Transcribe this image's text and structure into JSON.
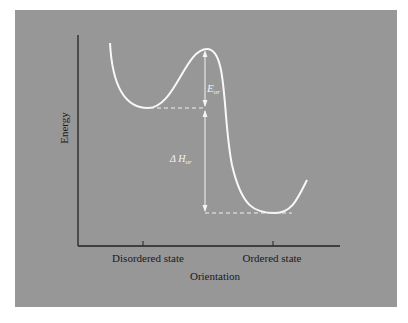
{
  "diagram": {
    "type": "energy-profile",
    "y_axis_label": "Energy",
    "x_axis_label": "Orientation",
    "x_ticks": [
      "Disordered state",
      "Ordered state"
    ],
    "annotations": {
      "activation_energy": {
        "symbol": "E",
        "subscript": "or"
      },
      "enthalpy_change": {
        "symbol": "Δ H",
        "subscript": "or"
      }
    },
    "colors": {
      "background": "#979797",
      "curve": "#f8f8f8",
      "axes": "#222222",
      "text": "#1a1a1a"
    },
    "curve_points": {
      "start": [
        110,
        43
      ],
      "disordered_minimum": [
        148,
        108
      ],
      "barrier_peak": [
        207,
        49
      ],
      "ordered_minimum": [
        275,
        213
      ],
      "end": [
        307,
        180
      ]
    }
  }
}
